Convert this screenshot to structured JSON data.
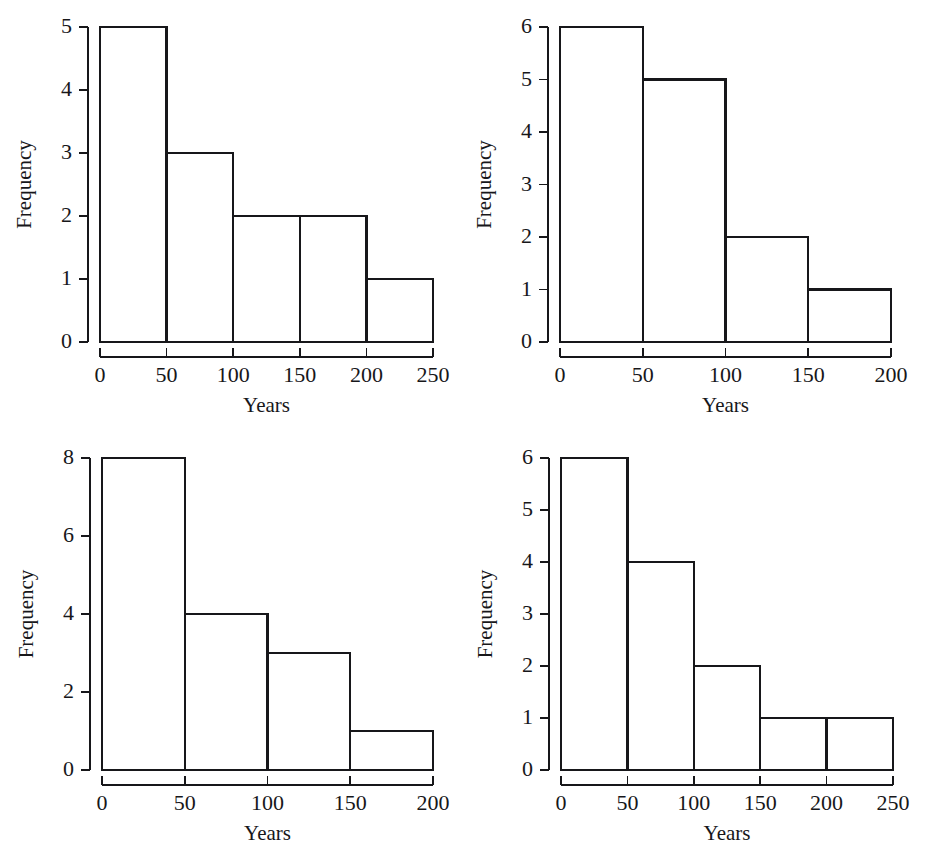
{
  "figure": {
    "width": 927,
    "height": 863,
    "background": "#ffffff",
    "ink_color": "#17171a",
    "layout": "2x2 grid of histogram panels"
  },
  "chart_data": [
    {
      "id": "panel-top-left",
      "type": "bar",
      "title": "",
      "xlabel": "Years",
      "ylabel": "Frequency",
      "bin_width": 50,
      "bin_edges": [
        0,
        50,
        100,
        150,
        200,
        250
      ],
      "categories": [
        "0-50",
        "50-100",
        "100-150",
        "150-200",
        "200-250"
      ],
      "values": [
        5,
        3,
        2,
        2,
        1
      ],
      "xlim": [
        0,
        250
      ],
      "ylim": [
        0,
        5
      ],
      "xticks": [
        0,
        50,
        100,
        150,
        200,
        250
      ],
      "xtick_labels": [
        "0",
        "50",
        "100",
        "150",
        "200",
        "250"
      ],
      "yticks": [
        0,
        1,
        2,
        3,
        4,
        5
      ],
      "ytick_labels": [
        "0",
        "1",
        "2",
        "3",
        "4",
        "5"
      ],
      "grid": false,
      "legend": "none"
    },
    {
      "id": "panel-top-right",
      "type": "bar",
      "title": "",
      "xlabel": "Years",
      "ylabel": "Frequency",
      "bin_width": 50,
      "bin_edges": [
        0,
        50,
        100,
        150,
        200
      ],
      "categories": [
        "0-50",
        "50-100",
        "100-150",
        "150-200"
      ],
      "values": [
        6,
        5,
        2,
        1
      ],
      "xlim": [
        0,
        200
      ],
      "ylim": [
        0,
        6
      ],
      "xticks": [
        0,
        50,
        100,
        150,
        200
      ],
      "xtick_labels": [
        "0",
        "50",
        "100",
        "150",
        "200"
      ],
      "yticks": [
        0,
        1,
        2,
        3,
        4,
        5,
        6
      ],
      "ytick_labels": [
        "0",
        "1",
        "2",
        "3",
        "4",
        "5",
        "6"
      ],
      "grid": false,
      "legend": "none"
    },
    {
      "id": "panel-bottom-left",
      "type": "bar",
      "title": "",
      "xlabel": "Years",
      "ylabel": "Frequency",
      "bin_width": 50,
      "bin_edges": [
        0,
        50,
        100,
        150,
        200
      ],
      "categories": [
        "0-50",
        "50-100",
        "100-150",
        "150-200"
      ],
      "values": [
        8,
        4,
        3,
        1
      ],
      "xlim": [
        0,
        200
      ],
      "ylim": [
        0,
        8
      ],
      "xticks": [
        0,
        50,
        100,
        150,
        200
      ],
      "xtick_labels": [
        "0",
        "50",
        "100",
        "150",
        "200"
      ],
      "yticks": [
        0,
        2,
        4,
        6,
        8
      ],
      "ytick_labels": [
        "0",
        "2",
        "4",
        "6",
        "8"
      ],
      "grid": false,
      "legend": "none"
    },
    {
      "id": "panel-bottom-right",
      "type": "bar",
      "title": "",
      "xlabel": "Years",
      "ylabel": "Frequency",
      "bin_width": 50,
      "bin_edges": [
        0,
        50,
        100,
        150,
        200,
        250
      ],
      "categories": [
        "0-50",
        "50-100",
        "100-150",
        "150-200",
        "200-250"
      ],
      "values": [
        6,
        4,
        2,
        1,
        1
      ],
      "xlim": [
        0,
        250
      ],
      "ylim": [
        0,
        6
      ],
      "xticks": [
        0,
        50,
        100,
        150,
        200,
        250
      ],
      "xtick_labels": [
        "0",
        "50",
        "100",
        "150",
        "200",
        "250"
      ],
      "yticks": [
        0,
        1,
        2,
        3,
        4,
        5,
        6
      ],
      "ytick_labels": [
        "0",
        "1",
        "2",
        "3",
        "4",
        "5",
        "6"
      ],
      "grid": false,
      "legend": "none"
    }
  ],
  "panel_geometry": [
    {
      "left": 100,
      "right": 433,
      "top": 27,
      "bottom": 342,
      "axis_gap": 15,
      "xlabel_y": 393
    },
    {
      "left": 560,
      "right": 891,
      "top": 27,
      "bottom": 342,
      "axis_gap": 15,
      "xlabel_y": 393
    },
    {
      "left": 102,
      "right": 433,
      "top": 458,
      "bottom": 770,
      "axis_gap": 15,
      "xlabel_y": 821
    },
    {
      "left": 561,
      "right": 893,
      "top": 458,
      "bottom": 770,
      "axis_gap": 15,
      "xlabel_y": 821
    }
  ]
}
